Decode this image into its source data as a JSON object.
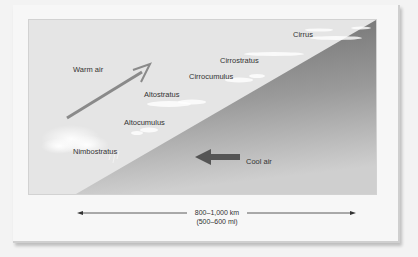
{
  "diagram": {
    "air_masses": {
      "warm": "Warm air",
      "cool": "Cool air"
    },
    "clouds": [
      {
        "name": "Cirrus"
      },
      {
        "name": "Cirrostratus"
      },
      {
        "name": "Cirrocumulus"
      },
      {
        "name": "Altostratus"
      },
      {
        "name": "Altocumulus"
      },
      {
        "name": "Nimbostratus"
      }
    ],
    "scale": {
      "distance_km": "800–1,000 km",
      "distance_mi": "(500–600 mi)"
    },
    "colors": {
      "warm_sky": "#e5e5e5",
      "cold_wedge_light": "#bdbdbd",
      "cold_wedge_dark": "#6e6e6e",
      "arrow": "#7a7a7a"
    }
  }
}
